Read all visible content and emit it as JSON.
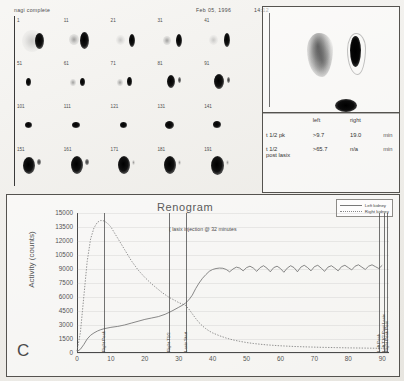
{
  "header": {
    "study_label": "nagi complete",
    "date": "Feb 05, 1996",
    "time": "14:12"
  },
  "scan_series": {
    "rows": [
      {
        "frames": [
          {
            "number": "1"
          },
          {
            "number": "11"
          },
          {
            "number": "21"
          },
          {
            "number": "31"
          },
          {
            "number": "41"
          }
        ]
      },
      {
        "frames": [
          {
            "number": "51"
          },
          {
            "number": "61"
          },
          {
            "number": "71"
          },
          {
            "number": "81"
          },
          {
            "number": "91"
          }
        ]
      },
      {
        "frames": [
          {
            "number": "101"
          },
          {
            "number": "111"
          },
          {
            "number": "121"
          },
          {
            "number": "131"
          },
          {
            "number": "141"
          }
        ]
      },
      {
        "frames": [
          {
            "number": "151"
          },
          {
            "number": "161"
          },
          {
            "number": "171"
          },
          {
            "number": "181"
          },
          {
            "number": "191"
          }
        ]
      }
    ]
  },
  "results": {
    "col_label_header": "",
    "col_left_header": "left",
    "col_right_header": "right",
    "rows": [
      {
        "label_line1": "t 1/2 pk",
        "label_line2": "",
        "left": ">9.7",
        "right": "19.0",
        "unit": "min"
      },
      {
        "label_line1": "t 1/2",
        "label_line2": "post lasix",
        "left": ">65.7",
        "right": "n/a",
        "unit": "min"
      }
    ]
  },
  "chart_data": {
    "type": "line",
    "title": "Renogram",
    "panel_letter": "C",
    "xlabel": "",
    "ylabel": "Activity (counts)",
    "xlim": [
      0,
      92
    ],
    "ylim": [
      0,
      15000
    ],
    "grid": true,
    "legend_position": "top-right",
    "annotation": "( lasix injection @ 32 minutes",
    "xticks": [
      0,
      10,
      20,
      30,
      40,
      50,
      60,
      70,
      80,
      90
    ],
    "yticks": [
      0,
      1500,
      3000,
      4500,
      6000,
      7500,
      9000,
      10500,
      12000,
      13500,
      15000
    ],
    "markers": [
      {
        "label": "Right Peak",
        "x": 8
      },
      {
        "label": "Right T1/2",
        "x": 27
      },
      {
        "label": "Lasix Start",
        "x": 32
      },
      {
        "label": "Left Peak",
        "x": 89
      },
      {
        "label": "Left T1/2 Post Lasix",
        "x": 90.5
      },
      {
        "label": "Right Peak Post",
        "x": 91.5
      }
    ],
    "series": [
      {
        "name": "Left kidney",
        "style": "solid",
        "color": "#6b6b6b",
        "x": [
          0,
          1,
          2,
          3,
          4,
          5,
          6,
          7,
          8,
          10,
          12,
          14,
          16,
          18,
          20,
          22,
          24,
          26,
          28,
          30,
          31,
          32,
          33,
          34,
          35,
          36,
          37,
          38,
          39,
          40,
          41,
          42,
          43,
          44,
          45,
          46,
          47,
          48,
          49,
          50,
          51,
          52,
          53,
          54,
          55,
          56,
          57,
          58,
          59,
          60,
          61,
          62,
          63,
          64,
          65,
          66,
          67,
          68,
          69,
          70,
          71,
          72,
          73,
          74,
          75,
          76,
          77,
          78,
          79,
          80,
          81,
          82,
          83,
          84,
          85,
          86,
          87,
          88,
          89,
          90
        ],
        "y": [
          150,
          400,
          900,
          1500,
          1900,
          2150,
          2350,
          2500,
          2600,
          2750,
          2850,
          3000,
          3200,
          3400,
          3600,
          3750,
          3900,
          4150,
          4500,
          4900,
          5100,
          5350,
          5700,
          6200,
          6900,
          7500,
          8000,
          8400,
          8750,
          8950,
          9050,
          9100,
          9080,
          8950,
          8700,
          9000,
          9200,
          9100,
          8800,
          9150,
          9300,
          9100,
          8750,
          9150,
          9350,
          9100,
          8700,
          9150,
          9300,
          9050,
          8650,
          9100,
          9350,
          9150,
          8700,
          9200,
          9400,
          9150,
          8800,
          9250,
          9400,
          9100,
          8750,
          9200,
          9350,
          9100,
          8800,
          9250,
          9400,
          9150,
          8900,
          9300,
          9450,
          9200,
          8950,
          9300,
          9450,
          9250,
          9050,
          9400
        ]
      },
      {
        "name": "Right kidney",
        "style": "dotted",
        "color": "#777777",
        "x": [
          0,
          1,
          2,
          3,
          4,
          5,
          6,
          7,
          8,
          9,
          10,
          11,
          12,
          13,
          14,
          15,
          16,
          17,
          18,
          19,
          20,
          21,
          22,
          23,
          24,
          25,
          26,
          27,
          28,
          29,
          30,
          31,
          32,
          33,
          34,
          35,
          36,
          37,
          38,
          39,
          40,
          42,
          44,
          46,
          48,
          50,
          52,
          54,
          56,
          58,
          60,
          64,
          68,
          72,
          76,
          80,
          84,
          88,
          90
        ],
        "y": [
          200,
          2200,
          6000,
          9800,
          12200,
          13400,
          14000,
          14200,
          14150,
          13900,
          13500,
          12900,
          12300,
          11700,
          11100,
          10500,
          9900,
          9400,
          8900,
          8500,
          8100,
          7750,
          7400,
          7100,
          6800,
          6500,
          6250,
          6000,
          5800,
          5600,
          5400,
          5250,
          5100,
          4700,
          4200,
          3700,
          3250,
          2900,
          2600,
          2350,
          2150,
          1850,
          1600,
          1400,
          1250,
          1120,
          1020,
          940,
          870,
          820,
          770,
          700,
          650,
          610,
          580,
          550,
          530,
          510,
          500
        ]
      }
    ]
  },
  "legend": {
    "items": [
      {
        "label": "Left kidney",
        "style": "solid"
      },
      {
        "label": "Right kidney",
        "style": "dotted"
      }
    ]
  }
}
